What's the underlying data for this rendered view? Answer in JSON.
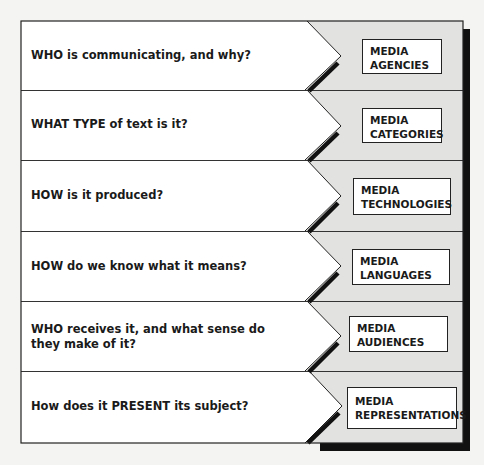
{
  "colors": {
    "page_background": "#f4f4f2",
    "left_panel": "#ffffff",
    "right_panel": "#e2e2e0",
    "border": "#222222",
    "shadow": "#111111"
  },
  "rows": [
    {
      "question": "WHO is communicating, and why?",
      "concept_line1": "MEDIA",
      "concept_line2": "AGENCIES"
    },
    {
      "question": "WHAT TYPE of text is it?",
      "concept_line1": "MEDIA",
      "concept_line2": "CATEGORIES"
    },
    {
      "question": "HOW is it produced?",
      "concept_line1": "MEDIA",
      "concept_line2": "TECHNOLOGIES"
    },
    {
      "question": "HOW do we know what it means?",
      "concept_line1": "MEDIA",
      "concept_line2": "LANGUAGES"
    },
    {
      "question": "WHO receives it, and what sense do they make of it?",
      "concept_line1": "MEDIA",
      "concept_line2": "AUDIENCES"
    },
    {
      "question": "How does it PRESENT its subject?",
      "concept_line1": "MEDIA",
      "concept_line2": "REPRESENTATIONS"
    }
  ]
}
